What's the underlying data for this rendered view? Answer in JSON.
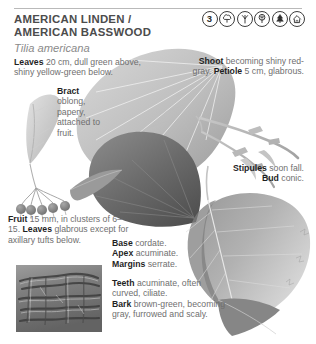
{
  "header": {
    "common_name_line1": "AMERICAN LINDEN /",
    "common_name_line2": "AMERICAN BASSWOOD",
    "scientific_name": "Tilia americana",
    "icons": [
      {
        "name": "number-badge-3",
        "label": "3"
      },
      {
        "name": "broadleaf-tree-icon",
        "label": ""
      },
      {
        "name": "branching-form-icon",
        "label": ""
      },
      {
        "name": "rounded-crown-tree-icon",
        "label": ""
      },
      {
        "name": "conifer-tree-icon",
        "label": ""
      },
      {
        "name": "shelter-house-icon",
        "label": ""
      }
    ]
  },
  "captions": {
    "leaves_top": {
      "term": "Leaves",
      "text": " 20 cm, dull green above, shiny yellow-green below."
    },
    "bract": {
      "term": "Bract",
      "text": " oblong, papery, attached to fruit."
    },
    "shoot": {
      "term1": "Shoot",
      "text1": " becoming shiny red-gray. ",
      "term2": "Petiole",
      "text2": " 5 cm, glabrous."
    },
    "stipules": {
      "term1": "Stipules",
      "text1": " soon fall. ",
      "term2": "Bud",
      "text2": " conic."
    },
    "fruit": {
      "term1": "Fruit",
      "text1": " 15 mm, in clusters of 6–15. ",
      "term2": "Leaves",
      "text2": " glabrous except for axillary tufts below."
    },
    "base": {
      "term1": "Base",
      "text1": " cordate.",
      "term2": "Apex",
      "text2": " acuminate.",
      "term3": "Margins",
      "text3": " serrate."
    },
    "teeth": {
      "term1": "Teeth",
      "text1": " acuminate, often curved, ciliate.",
      "term2": "Bark",
      "text2": " brown-green, becoming gray, furrowed and scaly."
    }
  },
  "artwork": {
    "bract_label": "bract-illustration",
    "fruit_cluster_label": "fruit-cluster-illustration",
    "leaf_upper_label": "upper-leaf-photo",
    "leaf_dark_label": "dark-leaf-photo",
    "leaf_right_label": "cordate-leaf-photo",
    "twig_label": "shoot-twig-illustration",
    "bark_label": "bark-photo"
  },
  "colors": {
    "heading": "#1f1f1f",
    "body_text": "#6f6f6f",
    "sci_name": "#8a8a8a",
    "rule": "#b9b9b9",
    "icon_stroke": "#3d3d3d"
  }
}
